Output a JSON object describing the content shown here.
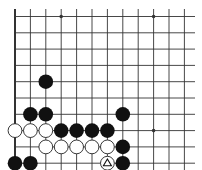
{
  "diagram": {
    "type": "go-board-fragment",
    "visible_region": "bottom-left corner",
    "grid": {
      "columns": 12,
      "rows": 10,
      "origin_x": 15,
      "origin_y": 16.5,
      "spacing_x": 15.4,
      "spacing_y": 16.3,
      "line_extent_right": 195,
      "line_top": 9,
      "edges": [
        "left",
        "bottom"
      ]
    },
    "colors": {
      "background": "#ffffff",
      "line": "#333333",
      "black_stone": "#111111",
      "white_stone_fill": "#ffffff",
      "white_stone_stroke": "#222222"
    },
    "hoshi": [
      {
        "col": 3,
        "row": 0
      },
      {
        "col": 9,
        "row": 0
      },
      {
        "col": 9,
        "row": 7
      }
    ],
    "stones": [
      {
        "color": "black",
        "col": 2,
        "row": 4
      },
      {
        "color": "black",
        "col": 1,
        "row": 6
      },
      {
        "color": "black",
        "col": 2,
        "row": 6
      },
      {
        "color": "black",
        "col": 7,
        "row": 6
      },
      {
        "color": "white",
        "col": 0,
        "row": 7
      },
      {
        "color": "white",
        "col": 1,
        "row": 7
      },
      {
        "color": "white",
        "col": 2,
        "row": 7
      },
      {
        "color": "black",
        "col": 3,
        "row": 7
      },
      {
        "color": "black",
        "col": 4,
        "row": 7
      },
      {
        "color": "black",
        "col": 5,
        "row": 7
      },
      {
        "color": "black",
        "col": 6,
        "row": 7
      },
      {
        "color": "white",
        "col": 2,
        "row": 8
      },
      {
        "color": "white",
        "col": 3,
        "row": 8
      },
      {
        "color": "white",
        "col": 4,
        "row": 8
      },
      {
        "color": "white",
        "col": 5,
        "row": 8
      },
      {
        "color": "white",
        "col": 6,
        "row": 8
      },
      {
        "color": "black",
        "col": 7,
        "row": 8
      },
      {
        "color": "black",
        "col": 0,
        "row": 9
      },
      {
        "color": "black",
        "col": 1,
        "row": 9
      },
      {
        "color": "white",
        "col": 6,
        "row": 9,
        "marker": "triangle"
      },
      {
        "color": "black",
        "col": 7,
        "row": 9
      },
      {
        "color": "black",
        "col": 4,
        "row": 10
      }
    ],
    "stone_radius": 7.3
  }
}
